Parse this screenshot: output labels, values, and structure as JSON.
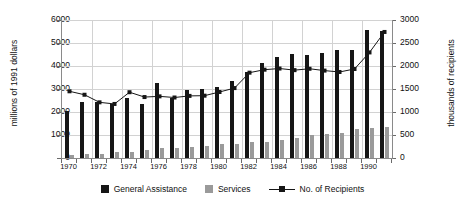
{
  "chart_data": {
    "type": "bar",
    "title": "",
    "xlabel": "",
    "ylabel": "millions of 1991 dollars",
    "y2label": "thousands of recipients",
    "grid": true,
    "legend_position": "bottom",
    "ylim": [
      0,
      6000
    ],
    "y2lim": [
      0,
      3000
    ],
    "yticks": [
      0,
      1000,
      2000,
      3000,
      4000,
      5000,
      6000
    ],
    "y2ticks": [
      0,
      500,
      1000,
      1500,
      2000,
      2500,
      3000
    ],
    "categories": [
      1970,
      1971,
      1972,
      1973,
      1974,
      1975,
      1976,
      1977,
      1978,
      1979,
      1980,
      1981,
      1982,
      1983,
      1984,
      1985,
      1986,
      1987,
      1988,
      1989,
      1990,
      1991
    ],
    "xtick_labels": [
      "1970",
      "1972",
      "1974",
      "1976",
      "1978",
      "1980",
      "1982",
      "1984",
      "1986",
      "1988",
      "1990"
    ],
    "series": [
      {
        "name": "General Assistance",
        "type": "bar",
        "axis": "left",
        "color": "#161616",
        "values": [
          2060,
          2420,
          2450,
          2340,
          2620,
          2370,
          3280,
          2620,
          2940,
          2980,
          3090,
          3340,
          3720,
          4140,
          4390,
          4540,
          4490,
          4550,
          4690,
          4690,
          5550,
          5540
        ]
      },
      {
        "name": "Services",
        "type": "bar",
        "axis": "left",
        "color": "#9a9a9a",
        "values": [
          150,
          165,
          185,
          240,
          275,
          370,
          415,
          440,
          490,
          540,
          625,
          630,
          680,
          710,
          800,
          875,
          985,
          1045,
          1080,
          1240,
          1320,
          1340
        ]
      },
      {
        "name": "No. of Recipients",
        "type": "line",
        "axis": "right",
        "color": "#161616",
        "values": [
          1450,
          1375,
          1210,
          1175,
          1430,
          1325,
          1340,
          1315,
          1350,
          1355,
          1435,
          1520,
          1855,
          1920,
          1945,
          1910,
          1940,
          1900,
          1870,
          1935,
          2295,
          2740
        ]
      }
    ]
  },
  "legend": {
    "items": [
      {
        "label": "General Assistance",
        "marker": "square-black"
      },
      {
        "label": "Services",
        "marker": "square-gray"
      },
      {
        "label": "No. of Recipients",
        "marker": "line-marker"
      }
    ]
  }
}
